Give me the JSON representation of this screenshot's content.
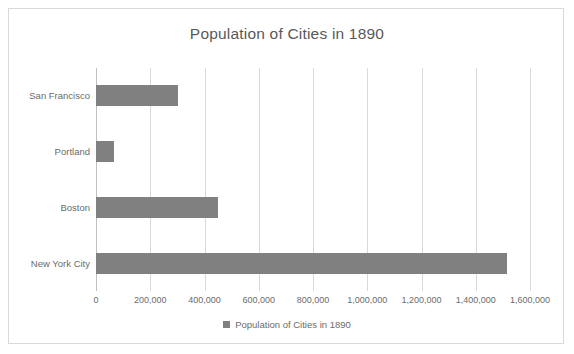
{
  "chart_data": {
    "type": "bar",
    "orientation": "horizontal",
    "title": "Population of Cities in 1890",
    "xlabel": "",
    "ylabel": "",
    "categories": [
      "San Francisco",
      "Portland",
      "Boston",
      "New York City"
    ],
    "values": [
      302000,
      66000,
      448000,
      1515000
    ],
    "series": [
      {
        "name": "Population of Cities in 1890",
        "values": [
          302000,
          66000,
          448000,
          1515000
        ],
        "color": "#808080"
      }
    ],
    "xlim": [
      0,
      1600000
    ],
    "xtick_values": [
      0,
      200000,
      400000,
      600000,
      800000,
      1000000,
      1200000,
      1400000,
      1600000
    ],
    "xtick_labels": [
      "0",
      "200,000",
      "400,000",
      "600,000",
      "800,000",
      "1,000,000",
      "1,200,000",
      "1,400,000",
      "1,600,000"
    ],
    "grid": "vertical",
    "legend": {
      "position": "bottom",
      "entries": [
        "Population of Cities in 1890"
      ]
    }
  },
  "colors": {
    "bar": "#808080",
    "gridline": "#d9d9d9",
    "axis": "#bfbfbf",
    "text": "#6b6b6b",
    "title_text": "#595959",
    "frame_border": "#d9d9d9",
    "background": "#ffffff"
  },
  "legend": {
    "label": "Population of Cities in 1890"
  }
}
